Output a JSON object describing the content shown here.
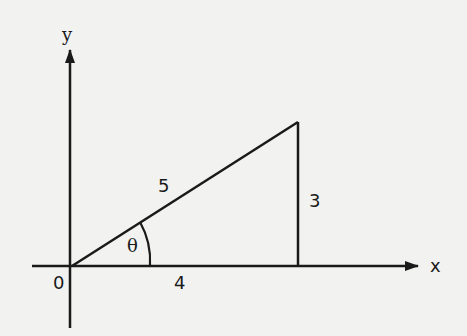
{
  "diagram": {
    "title": "",
    "axes": {
      "x_label": "x",
      "y_label": "y",
      "origin_label": "0"
    },
    "triangle": {
      "hypotenuse_label": "5",
      "adjacent_label": "4",
      "opposite_label": "3",
      "angle_label": "θ"
    },
    "colors": {
      "background": "#f2f2f0",
      "ink": "#1a1a1a"
    }
  }
}
